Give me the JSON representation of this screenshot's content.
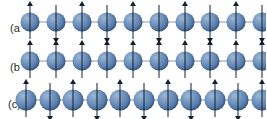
{
  "figure": {
    "width": 266,
    "height": 119,
    "background_color": "#ffffff",
    "sphere_color": "#5d82b0",
    "sphere_highlight_color": "#9db8d4",
    "sphere_shadow_color": "#3a5c8a",
    "bond_line_color": "#8e9aa6",
    "arrow_color": "#15202e",
    "label_color": "#2b2b2b"
  },
  "rows": [
    {
      "id": "row-a",
      "label": "(a",
      "label_x": 10,
      "label_y": 29,
      "center_y": 22,
      "track_left": 30,
      "track_right": 262,
      "site_count": 10,
      "sphere_diameter": 19,
      "shaft_length": 34,
      "ordering": "antiferromagnetic",
      "spins": [
        "up",
        "down",
        "up",
        "down",
        "up",
        "down",
        "up",
        "down",
        "up",
        "down"
      ]
    },
    {
      "id": "row-b",
      "label": "(b",
      "label_x": 10,
      "label_y": 68,
      "center_y": 61,
      "track_left": 30,
      "track_right": 262,
      "site_count": 10,
      "sphere_diameter": 19,
      "shaft_length": 34,
      "ordering": "ferromagnetic",
      "spins": [
        "up",
        "up",
        "up",
        "up",
        "up",
        "up",
        "up",
        "up",
        "up",
        "up"
      ]
    },
    {
      "id": "row-c",
      "label": "(c)",
      "label_x": 8,
      "label_y": 105,
      "center_y": 100,
      "track_left": 26,
      "track_right": 262,
      "site_count": 11,
      "sphere_diameter": 21,
      "shaft_length": 34,
      "ordering": "antiferromagnetic",
      "spins": [
        "up",
        "down",
        "up",
        "down",
        "up",
        "down",
        "up",
        "down",
        "up",
        "down",
        "up"
      ]
    }
  ]
}
